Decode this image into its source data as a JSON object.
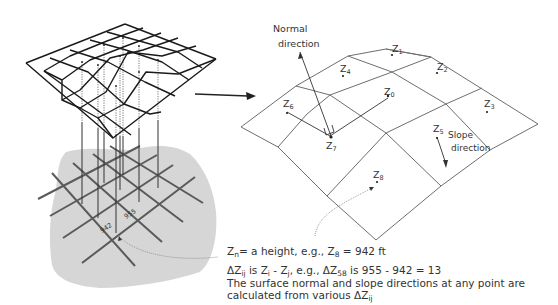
{
  "left_panel": {
    "ground_labels": {
      "value_942": "942",
      "value_955": "955"
    }
  },
  "right_panel": {
    "normal_label_line1": "Normal",
    "normal_label_line2": "direction",
    "slope_label_line1": "Slope",
    "slope_label_line2": "direction",
    "points": [
      {
        "id": "Z0",
        "base": "Z",
        "sub": "0"
      },
      {
        "id": "Z1",
        "base": "Z",
        "sub": "1"
      },
      {
        "id": "Z2",
        "base": "Z",
        "sub": "2"
      },
      {
        "id": "Z3",
        "base": "Z",
        "sub": "3"
      },
      {
        "id": "Z4",
        "base": "Z",
        "sub": "4"
      },
      {
        "id": "Z5",
        "base": "Z",
        "sub": "5"
      },
      {
        "id": "Z6",
        "base": "Z",
        "sub": "6"
      },
      {
        "id": "Z7",
        "base": "Z",
        "sub": "7"
      },
      {
        "id": "Z8",
        "base": "Z",
        "sub": "8"
      }
    ]
  },
  "captions": {
    "line1": {
      "a": "Z",
      "a_sub": "n",
      "b": "= a height, e.g., Z",
      "b_sub": "8",
      "c": " = 942 ft"
    },
    "line2": {
      "a": "ΔZ",
      "a_sub": "ij",
      "b": "  is Z",
      "b_sub": "i",
      "c": " - Z",
      "c_sub": "j",
      "d": ", e.g.,  ΔZ",
      "d_sub": "58",
      "e": " is  955 - 942 = 13"
    },
    "line3": "The surface normal and slope directions at any point are",
    "line4": {
      "a": "calculated from various  ΔZ",
      "a_sub": "ij"
    }
  },
  "colors": {
    "ground": "#d4d4d4",
    "ground_grid": "#555555",
    "mesh": "#1a1a1a",
    "right_mesh": "#777777",
    "text": "#333333"
  }
}
